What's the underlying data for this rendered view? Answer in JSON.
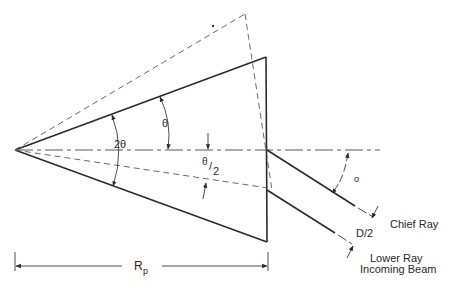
{
  "diagram": {
    "type": "optical-prism-geometry",
    "labels": {
      "two_theta": "2θ",
      "theta": "θ",
      "theta_half_num": "θ",
      "theta_half_slash": "/",
      "theta_half_den": "2",
      "incidence_angle": "o",
      "half_diameter": "D/2",
      "chief_ray": "Chief Ray",
      "lower_ray": "Lower Ray",
      "incoming_beam": "Incoming Beam",
      "radius_main": "R",
      "radius_sub": "p"
    },
    "elements": {
      "prism": "solid triangle (apex left, vertical right face)",
      "rotated_prism": "dashed outline rotated by θ",
      "optical_axis": "horizontal dash-dot centerline",
      "bisector": "dashed line at θ/2 below axis",
      "rays": [
        "chief ray",
        "lower ray"
      ]
    },
    "colors": {
      "line": "#2b2b2b",
      "dashed": "#6a6a6a",
      "background": "#ffffff"
    }
  }
}
